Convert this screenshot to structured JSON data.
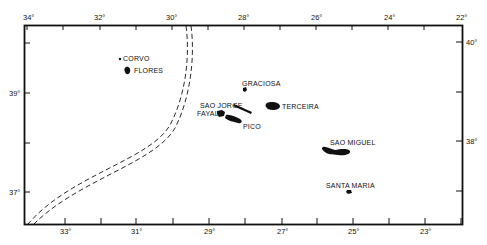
{
  "map": {
    "title": "Azores Islands",
    "longitude_top": [
      "34°",
      "32°",
      "30°",
      "28°",
      "26°",
      "24°",
      "22°"
    ],
    "longitude_bottom": [
      "33°",
      "31°",
      "29°",
      "27°",
      "25°",
      "23°"
    ],
    "latitude_left": [
      "39°",
      "37°"
    ],
    "latitude_right": [
      "40°",
      "38°"
    ],
    "islands": [
      {
        "name": "CORVO"
      },
      {
        "name": "FLORES"
      },
      {
        "name": "GRACIOSA"
      },
      {
        "name": "SAO JORGE"
      },
      {
        "name": "TERCEIRA"
      },
      {
        "name": "FAYAL"
      },
      {
        "name": "PICO"
      },
      {
        "name": "SAO MIGUEL"
      },
      {
        "name": "SANTA MARIA"
      }
    ],
    "colors": {
      "ink": "#111111",
      "background": "#ffffff"
    }
  }
}
